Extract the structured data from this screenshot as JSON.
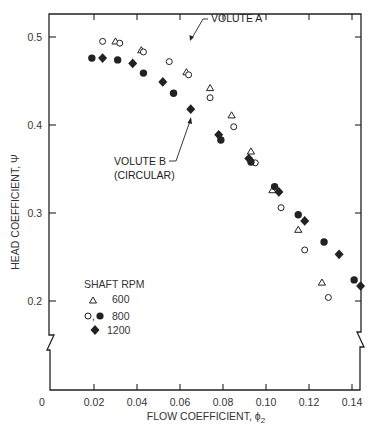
{
  "chart_data": {
    "type": "scatter",
    "title": "",
    "xlabel": "FLOW COEFFICIENT, ϕ",
    "xlabel_subscript": "2",
    "ylabel": "HEAD COEFFICIENT, Ψ",
    "xlim": [
      0,
      0.145
    ],
    "ylim": [
      0.2,
      0.5
    ],
    "y_axis_break": true,
    "grid": false,
    "x_ticks": [
      0.02,
      0.04,
      0.06,
      0.08,
      0.1,
      0.12,
      0.14
    ],
    "x_tick_labels": [
      "0",
      "0.02",
      "0.04",
      "0.06",
      "0.08",
      "0.10",
      "0.12",
      "0.14"
    ],
    "y_ticks": [
      0.5,
      0.4,
      0.3,
      0.2
    ],
    "y_tick_labels": [
      "0.5",
      "0.4",
      "0.3",
      "0.2"
    ],
    "legend": {
      "title": "SHAFT RPM",
      "position": "lower-left",
      "entries": [
        {
          "marker": "open-triangle",
          "label": "600"
        },
        {
          "marker": "open-circle, filled-circle",
          "label": "800",
          "marker_text": "○,"
        },
        {
          "marker": "filled-diamond",
          "label": "1200"
        }
      ]
    },
    "annotations": [
      {
        "text": "VOLUTE A",
        "points_to": "open markers"
      },
      {
        "text": "VOLUTE B",
        "text2": "(CIRCULAR)",
        "points_to": "filled markers"
      }
    ],
    "series": [
      {
        "name": "Volute A, 600 RPM",
        "marker": "open-triangle",
        "x": [
          0.03,
          0.042,
          0.063,
          0.074,
          0.084,
          0.093,
          0.103,
          0.115,
          0.126
        ],
        "y": [
          0.495,
          0.485,
          0.46,
          0.442,
          0.411,
          0.37,
          0.326,
          0.281,
          0.221
        ]
      },
      {
        "name": "Volute A, 800 RPM",
        "marker": "open-circle",
        "x": [
          0.024,
          0.032,
          0.043,
          0.055,
          0.064,
          0.074,
          0.085,
          0.095,
          0.107,
          0.118,
          0.129
        ],
        "y": [
          0.495,
          0.493,
          0.483,
          0.472,
          0.457,
          0.431,
          0.398,
          0.357,
          0.306,
          0.258,
          0.204
        ]
      },
      {
        "name": "Volute B (Circular), 800 RPM",
        "marker": "filled-circle",
        "x": [
          0.019,
          0.031,
          0.043,
          0.057,
          0.079,
          0.093,
          0.104,
          0.115,
          0.127,
          0.141
        ],
        "y": [
          0.476,
          0.474,
          0.459,
          0.436,
          0.383,
          0.358,
          0.33,
          0.298,
          0.267,
          0.224
        ]
      },
      {
        "name": "Volute B (Circular), 1200 RPM",
        "marker": "filled-diamond",
        "x": [
          0.024,
          0.038,
          0.052,
          0.065,
          0.078,
          0.092,
          0.106,
          0.118,
          0.134,
          0.144
        ],
        "y": [
          0.476,
          0.47,
          0.449,
          0.418,
          0.389,
          0.362,
          0.324,
          0.291,
          0.253,
          0.217
        ]
      }
    ]
  },
  "colors": {
    "ink": "#222222",
    "background": "#ffffff"
  }
}
